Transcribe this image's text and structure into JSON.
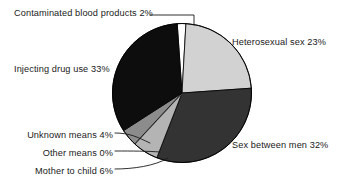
{
  "figure": {
    "background_color": "#ffffff",
    "outline_color": "#000000"
  },
  "chart_data": {
    "type": "pie",
    "title": "",
    "subtitle": "",
    "xlabel": "",
    "ylabel": "",
    "legend_position": "none",
    "grid": false,
    "labels_style": "callout-with-leader-lines",
    "units": "percent",
    "total": 100,
    "categories": [
      "Contaminated blood products",
      "Heterosexual sex",
      "Sex between men",
      "Mother to child",
      "Other means",
      "Unknown means",
      "Injecting drug use"
    ],
    "values": [
      2,
      23,
      32,
      6,
      0,
      4,
      33
    ],
    "slice_colors": [
      "#ffffff",
      "#d2d2d2",
      "#333333",
      "#b4b4b4",
      "#6e6e6e",
      "#8c8c8c",
      "#0d0d0d"
    ],
    "slices": [
      {
        "name": "contaminated-blood-products",
        "label": "Contaminated blood products 2%",
        "category": "Contaminated blood products",
        "value": 2,
        "color": "#ffffff"
      },
      {
        "name": "heterosexual-sex",
        "label": "Heterosexual sex 23%",
        "category": "Heterosexual sex",
        "value": 23,
        "color": "#d2d2d2"
      },
      {
        "name": "sex-between-men",
        "label": "Sex between men 32%",
        "category": "Sex between men",
        "value": 32,
        "color": "#333333"
      },
      {
        "name": "mother-to-child",
        "label": "Mother to child 6%",
        "category": "Mother to child",
        "value": 6,
        "color": "#b4b4b4"
      },
      {
        "name": "other-means",
        "label": "Other means 0%",
        "category": "Other means",
        "value": 0,
        "color": "#6e6e6e"
      },
      {
        "name": "unknown-means",
        "label": "Unknown means 4%",
        "category": "Unknown means",
        "value": 4,
        "color": "#8c8c8c"
      },
      {
        "name": "injecting-drug-use",
        "label": "Injecting drug use 33%",
        "category": "Injecting drug use",
        "value": 33,
        "color": "#0d0d0d"
      }
    ]
  }
}
